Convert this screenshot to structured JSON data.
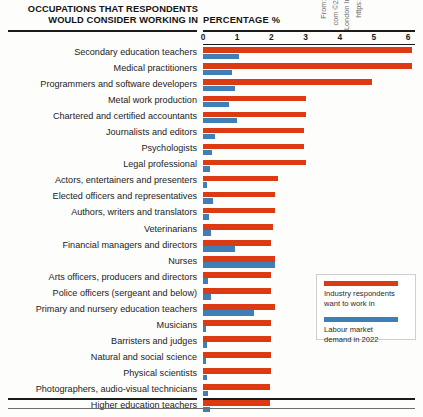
{
  "header": {
    "title_line1": "OCCUPATIONS THAT RESPONDENTS",
    "title_line2": "WOULD CONSIDER WORKING IN",
    "axis_title": "PERCENTAGE %"
  },
  "legend": {
    "red_label_line1": "Industry respondents",
    "red_label_line2": "want to work in",
    "blue_label_line1": "Labour market",
    "blue_label_line2": "demand in 2022",
    "red_color": "#dc3a13",
    "blue_color": "#3f7fb5"
  },
  "credit": {
    "line1": "From: https://www.cityandguilds.",
    "line2": "com ©2015 The City and Guilds of",
    "line3": "London Institute. All rights reserved.",
    "line4": "https://www.economicmodelling.",
    "line5": "co.uk/contact/"
  },
  "chart_data": {
    "type": "bar",
    "orientation": "horizontal",
    "title": "OCCUPATIONS THAT RESPONDENTS WOULD CONSIDER WORKING IN",
    "xlabel": "PERCENTAGE %",
    "ylabel": "",
    "xlim": [
      0,
      6.2
    ],
    "grid": false,
    "legend_position": "right-bottom",
    "ticks": [
      0,
      1,
      2,
      3,
      4,
      5,
      6
    ],
    "tick_labels": [
      "0",
      "1",
      "2",
      "3",
      "4",
      "5",
      "6"
    ],
    "categories": [
      "Secondary education teachers",
      "Medical practitioners",
      "Programmers and software developers",
      "Metal work production",
      "Chartered and certified accountants",
      "Journalists and editors",
      "Psychologists",
      "Legal professional",
      "Actors, entertainers and presenters",
      "Elected officers and representatives",
      "Authors, writers and translators",
      "Veterinarians",
      "Financial managers and directors",
      "Nurses",
      "Arts officers, producers and directors",
      "Police officers (sergeant and below)",
      "Primary and nursery education teachers",
      "Musicians",
      "Barristers and judges",
      "Natural and social science",
      "Physical scientists",
      "Photographers, audio-visual technicians",
      "Higher education teachers"
    ],
    "series": [
      {
        "name": "Industry respondents want to work in",
        "color": "#dc3a13",
        "values": [
          6.1,
          6.1,
          4.95,
          3.0,
          3.0,
          2.95,
          2.95,
          3.0,
          2.2,
          2.1,
          2.1,
          2.05,
          2.0,
          2.1,
          2.0,
          2.0,
          2.1,
          2.0,
          2.0,
          2.0,
          2.0,
          1.95,
          1.95
        ]
      },
      {
        "name": "Labour market demand in 2022",
        "color": "#3f7fb5",
        "values": [
          1.05,
          0.85,
          0.95,
          0.75,
          1.0,
          0.35,
          0.25,
          0.2,
          0.12,
          0.3,
          0.18,
          0.22,
          0.95,
          2.1,
          0.15,
          0.22,
          1.5,
          0.1,
          0.12,
          0.1,
          0.12,
          0.16,
          0.2
        ]
      }
    ]
  }
}
